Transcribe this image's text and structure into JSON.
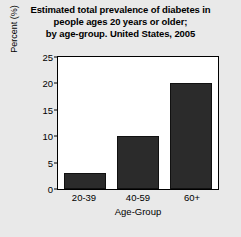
{
  "chart_data": {
    "type": "bar",
    "title": "Estimated total prevalence of diabetes in people ages 20 years or older; by age-group. United States, 2005",
    "title_lines": [
      "Estimated total prevalence of diabetes in",
      "people ages 20 years or older;",
      "by age-group. United States, 2005"
    ],
    "categories": [
      "20-39",
      "40-59",
      "60+"
    ],
    "values": [
      3,
      10,
      20
    ],
    "xlabel": "Age-Group",
    "ylabel": "Percent (%)",
    "ylim": [
      0,
      25
    ],
    "yticks": [
      0,
      5,
      10,
      15,
      20,
      25
    ],
    "ytick_labels": [
      "0",
      "5",
      "10",
      "15",
      "20",
      "25"
    ],
    "grid": false,
    "legend": false,
    "bar_color": "#2b2b2b",
    "plot_background": "#ffffff",
    "figure_background": "#e9e9e9",
    "axis_color": "#000000"
  }
}
